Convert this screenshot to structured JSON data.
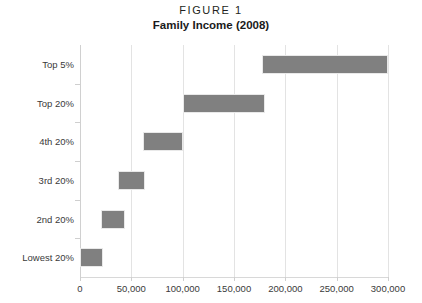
{
  "figure": {
    "label": "FIGURE 1",
    "title": "Family Income (2008)"
  },
  "chart_data": {
    "type": "bar",
    "orientation": "horizontal",
    "bar_style": "floating-range",
    "title": "Family Income (2008)",
    "subtitle": "FIGURE 1",
    "xlabel": "",
    "ylabel": "",
    "xlim": [
      0,
      300000
    ],
    "ylim": null,
    "grid": true,
    "legend": false,
    "legend_position": "none",
    "bar_color": "#808080",
    "bar_border_color": "#e9e9e9",
    "gridline_color": "#e3e3e3",
    "categories": [
      "Lowest 20%",
      "2nd 20%",
      "3rd 20%",
      "4th 20%",
      "Top 20%",
      "Top 5%"
    ],
    "category_order_top_to_bottom": [
      "Top 5%",
      "Top 20%",
      "4th 20%",
      "3rd 20%",
      "2nd 20%",
      "Lowest 20%"
    ],
    "ranges": [
      {
        "category": "Lowest 20%",
        "start": 0,
        "end": 22000
      },
      {
        "category": "2nd 20%",
        "start": 20000,
        "end": 44000
      },
      {
        "category": "3rd 20%",
        "start": 37000,
        "end": 63000
      },
      {
        "category": "4th 20%",
        "start": 61000,
        "end": 100000
      },
      {
        "category": "Top 20%",
        "start": 100000,
        "end": 180000
      },
      {
        "category": "Top 5%",
        "start": 177000,
        "end": 300000
      }
    ],
    "xticks": [
      0,
      50000,
      100000,
      150000,
      200000,
      250000,
      300000
    ],
    "xticklabels": [
      "0",
      "50,000",
      "100,000",
      "150,000",
      "200,000",
      "250,000",
      "300,000"
    ]
  }
}
